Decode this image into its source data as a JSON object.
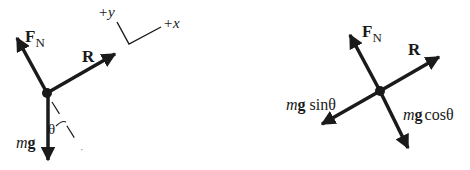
{
  "left_diagram": {
    "forces": {
      "normal": {
        "symbol": "F",
        "subscript": "N"
      },
      "resistance": {
        "symbol": "R"
      },
      "weight": {
        "italic": "m",
        "bold": "g"
      }
    },
    "angle_label": "θ",
    "axes": {
      "y_label": "+y",
      "x_label": "+x"
    }
  },
  "right_diagram": {
    "forces": {
      "normal": {
        "symbol": "F",
        "subscript": "N"
      },
      "resistance": {
        "symbol": "R"
      },
      "weight_parallel": {
        "italic": "m",
        "bold": "g",
        "trig": "sinθ"
      },
      "weight_perpendicular": {
        "italic": "m",
        "bold": "g",
        "trig": "cosθ"
      }
    }
  },
  "colors": {
    "ink": "#1a1a1a",
    "background": "#ffffff"
  }
}
